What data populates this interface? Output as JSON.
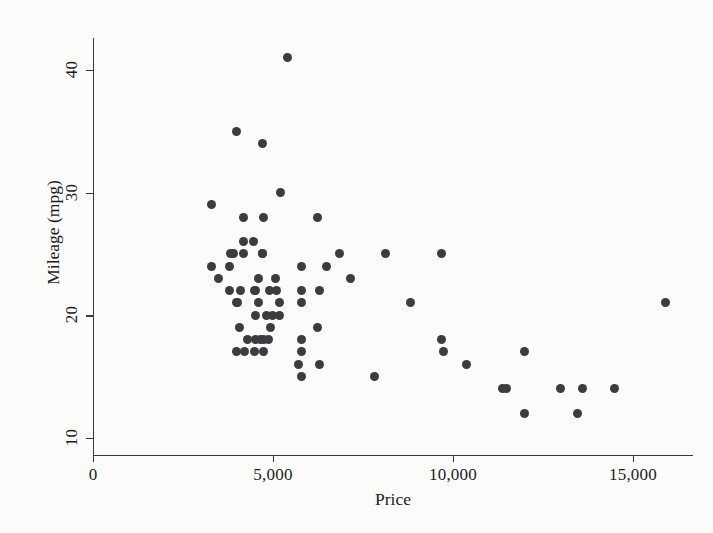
{
  "chart_data": {
    "type": "scatter",
    "title": "",
    "xlabel": "Price",
    "ylabel": "Mileage (mpg)",
    "xlim": [
      0,
      16667
    ],
    "ylim": [
      8.6,
      42.6
    ],
    "xticks": [
      0,
      5000,
      10000,
      15000
    ],
    "xticklabels": [
      "0",
      "5,000",
      "10,000",
      "15,000"
    ],
    "yticks": [
      10,
      20,
      30,
      40
    ],
    "yticklabels": [
      "10",
      "20",
      "30",
      "40"
    ],
    "grid": false,
    "legend": false,
    "marker": "filled-circle",
    "marker_color": "#3c3c40",
    "background_color": "#fbfbfa",
    "axis_color": "#3a3a3a",
    "series": [
      {
        "name": "mileage-vs-price",
        "x": [
          4099,
          4749,
          3799,
          4816,
          7827,
          5788,
          4453,
          5189,
          10372,
          4082,
          11385,
          14500,
          15906,
          3299,
          5705,
          4504,
          5104,
          5798,
          4934,
          5222,
          4723,
          4172,
          9690,
          6295,
          9735,
          6229,
          4589,
          5079,
          8129,
          4296,
          5799,
          4499,
          4195,
          3495,
          6851,
          4516,
          6303,
          3291,
          8814,
          5172,
          4733,
          4890,
          4181,
          4187,
          5788,
          4504,
          4874,
          4647,
          7140,
          6486,
          3995,
          5799,
          4499,
          4995,
          9690,
          11497,
          13594,
          13466,
          3984,
          3798,
          3995,
          4010,
          3895,
          6229,
          3829,
          4589,
          4697,
          5799,
          5397,
          4697,
          11995,
          4697,
          12990,
          11995
        ],
        "y": [
          22,
          17,
          22,
          20,
          15,
          18,
          26,
          20,
          16,
          19,
          14,
          14,
          21,
          29,
          16,
          22,
          22,
          24,
          19,
          30,
          18,
          26,
          18,
          16,
          17,
          19,
          23,
          23,
          25,
          18,
          15,
          17,
          17,
          23,
          25,
          20,
          22,
          24,
          21,
          21,
          28,
          22,
          25,
          28,
          21,
          18,
          18,
          18,
          23,
          24,
          17,
          17,
          22,
          20,
          25,
          14,
          14,
          12,
          35,
          24,
          21,
          21,
          25,
          28,
          25,
          21,
          25,
          22,
          41,
          25,
          17,
          34,
          14,
          12
        ]
      }
    ]
  },
  "axis": {
    "x_title": "Price",
    "y_title": "Mileage (mpg)",
    "x_tick_labels": [
      "0",
      "5,000",
      "10,000",
      "15,000"
    ],
    "y_tick_labels": [
      "10",
      "20",
      "30",
      "40"
    ]
  }
}
